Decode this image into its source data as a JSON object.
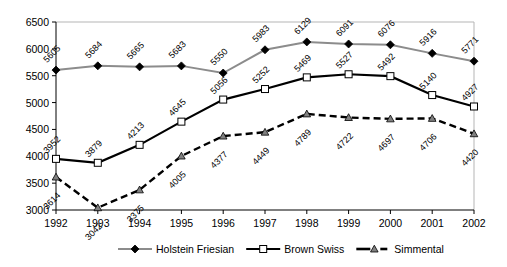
{
  "chart_data": {
    "type": "line",
    "title": "",
    "xlabel": "",
    "ylabel": "",
    "categories": [
      "1992",
      "1993",
      "1994",
      "1995",
      "1996",
      "1997",
      "1998",
      "1999",
      "2000",
      "2001",
      "2002"
    ],
    "xlim": [
      1992,
      2002
    ],
    "ylim": [
      3000,
      6500
    ],
    "yticks": [
      3000,
      3500,
      4000,
      4500,
      5000,
      5500,
      6000,
      6500
    ],
    "grid": false,
    "legend_position": "bottom",
    "series": [
      {
        "name": "Holstein Friesian",
        "color": "#8c8c8c",
        "marker": "diamond",
        "marker_fill": "#000000",
        "line_style": "solid",
        "values": [
          5605,
          5684,
          5665,
          5683,
          5550,
          5983,
          6129,
          6091,
          6076,
          5916,
          5771
        ]
      },
      {
        "name": "Brown Swiss",
        "color": "#000000",
        "marker": "square",
        "marker_fill": "#ffffff",
        "line_style": "solid",
        "values": [
          3952,
          3879,
          4213,
          4645,
          5056,
          5252,
          5469,
          5527,
          5492,
          5140,
          4927
        ]
      },
      {
        "name": "Simmental",
        "color": "#000000",
        "marker": "triangle",
        "marker_fill": "#808080",
        "line_style": "dashed",
        "values": [
          3614,
          3042,
          3375,
          4005,
          4377,
          4449,
          4789,
          4722,
          4697,
          4706,
          4420
        ]
      }
    ]
  },
  "axis": {
    "ytick_labels": [
      "3000",
      "3500",
      "4000",
      "4500",
      "5000",
      "5500",
      "6000",
      "6500"
    ],
    "xtick_labels": [
      "1992",
      "1993",
      "1994",
      "1995",
      "1996",
      "1997",
      "1998",
      "1999",
      "2000",
      "2001",
      "2002"
    ]
  },
  "legend": {
    "items": [
      {
        "label": "Holstein Friesian"
      },
      {
        "label": "Brown Swiss"
      },
      {
        "label": "Simmental"
      }
    ]
  }
}
